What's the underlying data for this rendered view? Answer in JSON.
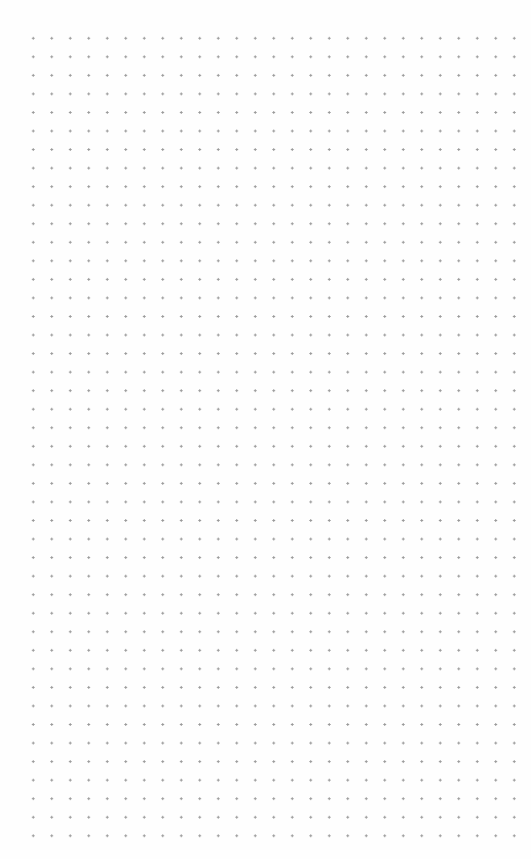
{
  "page": {
    "type": "dot-grid-paper",
    "grid": {
      "columns": 27,
      "rows": 44,
      "spacing_px": 18.5,
      "dot_color": "#9a9a9a",
      "background_color": "#fefefe"
    }
  }
}
